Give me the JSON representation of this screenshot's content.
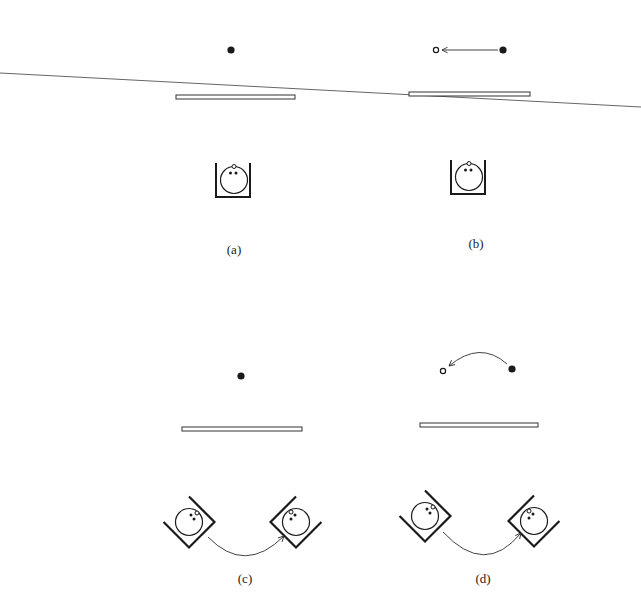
{
  "figure": {
    "panels": [
      {
        "id": "a",
        "label": "(a)",
        "description": "Point above mirror, observer in upright box"
      },
      {
        "id": "b",
        "label": "(b)",
        "description": "Point displaced leftwards (arrow) while mirror tilts"
      },
      {
        "id": "c",
        "label": "(c)",
        "description": "Observer box rotates from left to right (curved arrow), point fixed"
      },
      {
        "id": "d",
        "label": "(d)",
        "description": "Observer box rotates and point moves along curved arrow"
      }
    ],
    "colors": {
      "ink": "#1a1a1a",
      "line": "#555555",
      "background": "#ffffff"
    }
  }
}
